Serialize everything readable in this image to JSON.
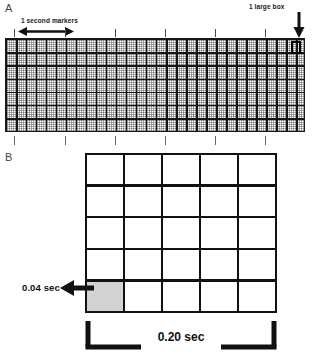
{
  "figure": {
    "panels": [
      {
        "letter": "A",
        "name": "ecg-paper-strip",
        "annotations": {
          "second_markers_label": "1 second markers",
          "large_box_label": "1 large box"
        },
        "grid": {
          "large_columns": 30,
          "large_rows": 7,
          "small_per_large": 5,
          "paper_color": "#cfcfcf",
          "line_color": "#141414"
        },
        "tick_marks": {
          "above_count": 6,
          "below_count": 6
        }
      },
      {
        "letter": "B",
        "name": "single-large-box-detail",
        "grid": {
          "columns": 5,
          "rows": 5,
          "cell_color": "#ffffff",
          "shaded_cell_color": "#d2d2d2",
          "line_color": "#111111",
          "shaded_cell_position": "bottom-left"
        },
        "annotations": {
          "small_box_label": "0.04 sec",
          "large_box_span_label": "0.20 sec"
        }
      }
    ]
  }
}
